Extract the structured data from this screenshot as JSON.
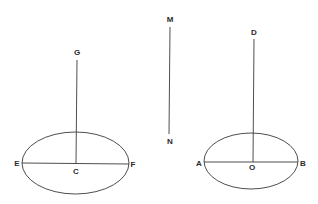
{
  "figure": {
    "left_ellipse": {
      "labels": {
        "top": "G",
        "left": "E",
        "center": "C",
        "right": "F"
      }
    },
    "segment": {
      "labels": {
        "top": "M",
        "bottom": "N"
      }
    },
    "right_ellipse": {
      "labels": {
        "top": "D",
        "left": "A",
        "center": "O",
        "right": "B"
      }
    }
  },
  "colors": {
    "ink": "#3a3a3a",
    "background": "#ffffff"
  }
}
